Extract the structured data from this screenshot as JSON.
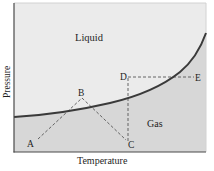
{
  "diagram": {
    "type": "phase-diagram",
    "x_axis_label": "Temperature",
    "y_axis_label": "Pressure",
    "regions": [
      {
        "name": "liquid",
        "label": "Liquid",
        "color": "#ebebeb"
      },
      {
        "name": "gas",
        "label": "Gas",
        "color": "#d7d7d7"
      }
    ],
    "points": [
      {
        "label": "A"
      },
      {
        "label": "B"
      },
      {
        "label": "C"
      },
      {
        "label": "D"
      },
      {
        "label": "E"
      }
    ],
    "paths": [
      {
        "from": "A",
        "to": "B",
        "style": "dashed"
      },
      {
        "from": "B",
        "to": "C",
        "style": "dashed"
      },
      {
        "from": "C",
        "to": "D",
        "style": "dashed"
      },
      {
        "from": "D",
        "to": "E",
        "style": "dashed"
      }
    ],
    "colors": {
      "curve": "#3a3a3a",
      "axis": "#4a4a4a",
      "dashed": "#555555",
      "frame": "#cfcfcf"
    }
  }
}
